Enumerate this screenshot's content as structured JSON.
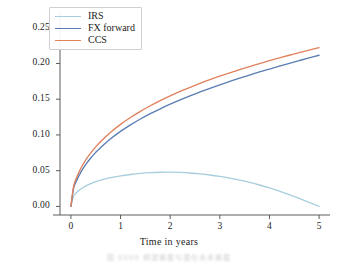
{
  "chart_data": {
    "type": "line",
    "title": "",
    "xlabel": "Time in years",
    "ylabel": "PFE",
    "xlim": [
      -0.22,
      5.22
    ],
    "ylim": [
      -0.012,
      0.272
    ],
    "xticks": [
      "0",
      "1",
      "2",
      "3",
      "4",
      "5"
    ],
    "xtick_values": [
      0,
      1,
      2,
      3,
      4,
      5
    ],
    "yticks": [
      "0.00",
      "0.05",
      "0.10",
      "0.15",
      "0.20",
      "0.25"
    ],
    "ytick_values": [
      0.0,
      0.05,
      0.1,
      0.15,
      0.2,
      0.25
    ],
    "grid": false,
    "legend_position": "upper left",
    "x": [
      0,
      0.05,
      0.1,
      0.2,
      0.3,
      0.4,
      0.5,
      0.6,
      0.8,
      1.0,
      1.2,
      1.4,
      1.6,
      1.8,
      2.0,
      2.2,
      2.4,
      2.6,
      2.8,
      3.0,
      3.2,
      3.4,
      3.6,
      3.8,
      4.0,
      4.2,
      4.4,
      4.6,
      4.8,
      5.0
    ],
    "series": [
      {
        "name": "IRS",
        "color": "#a8cede",
        "values": [
          0.0,
          0.0135,
          0.0183,
          0.0243,
          0.0287,
          0.032,
          0.0347,
          0.0369,
          0.0403,
          0.0428,
          0.0447,
          0.0462,
          0.0472,
          0.0478,
          0.0479,
          0.0476,
          0.0468,
          0.0456,
          0.044,
          0.042,
          0.0396,
          0.0368,
          0.0336,
          0.03,
          0.026,
          0.0215,
          0.0166,
          0.0114,
          0.0058,
          0.0
        ]
      },
      {
        "name": "FX forward",
        "color": "#5a7db4",
        "values": [
          0.0,
          0.024,
          0.034,
          0.048,
          0.0588,
          0.0677,
          0.0756,
          0.0826,
          0.0947,
          0.105,
          0.1141,
          0.1223,
          0.1297,
          0.1366,
          0.143,
          0.149,
          0.1547,
          0.1601,
          0.1652,
          0.1701,
          0.1748,
          0.1794,
          0.1838,
          0.1881,
          0.1922,
          0.1962,
          0.2002,
          0.204,
          0.2078,
          0.2115
        ]
      },
      {
        "name": "CCS",
        "color": "#e0815c",
        "values": [
          0.0,
          0.0268,
          0.038,
          0.0534,
          0.0651,
          0.0748,
          0.0833,
          0.0908,
          0.1038,
          0.1148,
          0.1244,
          0.133,
          0.1408,
          0.148,
          0.1546,
          0.1608,
          0.1666,
          0.1721,
          0.1773,
          0.1822,
          0.1869,
          0.1914,
          0.1957,
          0.1999,
          0.2039,
          0.2078,
          0.2115,
          0.2152,
          0.2187,
          0.2221
        ]
      }
    ]
  },
  "legend": {
    "entries": [
      {
        "label": "IRS"
      },
      {
        "label": "FX forward"
      },
      {
        "label": "CCS"
      }
    ]
  },
  "caption": {
    "text": "图 0000 期望暴露与潜在未来暴露"
  }
}
